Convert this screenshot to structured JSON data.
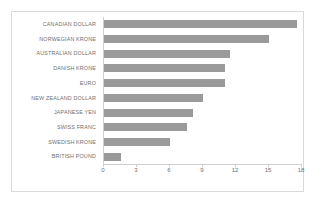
{
  "chart_data": {
    "type": "bar",
    "orientation": "horizontal",
    "title": "",
    "subtitle": "",
    "xlabel": "",
    "ylabel": "",
    "categories": [
      "CANADIAN DOLLAR",
      "NORWEGIAN KRONE",
      "AUSTRALIAN DOLLAR",
      "DANISH KRONE",
      "EURO",
      "NEW ZEALAND DOLLAR",
      "JAPANESE YEN",
      "SWISS FRANC",
      "SWEDISH KRONE",
      "BRITISH POUND"
    ],
    "values": [
      17.6,
      15.1,
      11.5,
      11.1,
      11.1,
      9.1,
      8.2,
      7.6,
      6.1,
      1.6
    ],
    "xlim": [
      0,
      18
    ],
    "xticks": [
      0,
      3,
      6,
      9,
      12,
      15,
      18
    ],
    "xtick_labels": [
      "0",
      "3",
      "6",
      "9",
      "12",
      "15",
      "18"
    ],
    "grid": false,
    "legend": null,
    "legend_position": "none",
    "annotations": [],
    "colors": {
      "bar": "#9a9a9a",
      "axis_line": "#cfcfcf",
      "tick_text": "#6f6f6f",
      "category_text": "#6f6f6f",
      "frame": "#d9d9d9",
      "background": "#ffffff"
    }
  }
}
